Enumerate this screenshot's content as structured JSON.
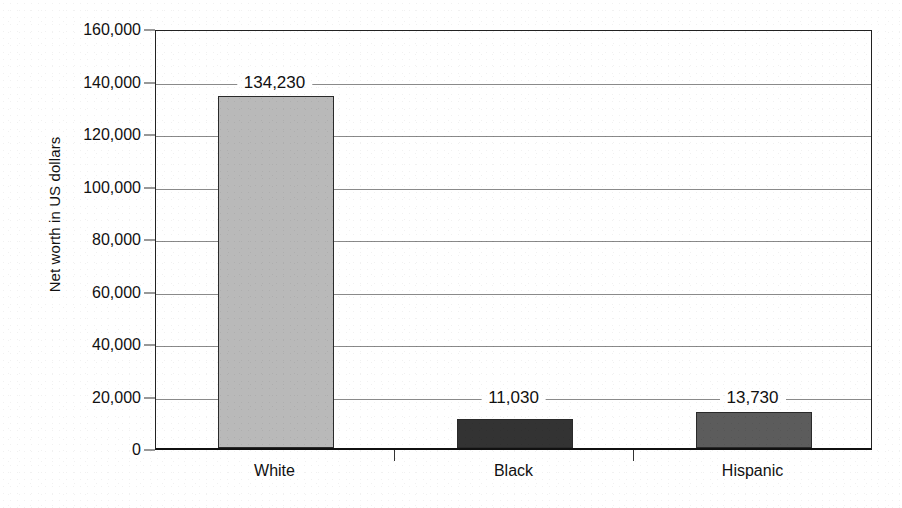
{
  "chart_data": {
    "type": "bar",
    "title": "",
    "xlabel": "",
    "ylabel": "Net worth in US dollars",
    "categories": [
      "White",
      "Black",
      "Hispanic"
    ],
    "values": [
      134230,
      11030,
      13730
    ],
    "value_labels": [
      "134,230",
      "11,030",
      "13,730"
    ],
    "series": [
      {
        "name": "Median net worth",
        "values": [
          134230,
          11030,
          13730
        ]
      }
    ],
    "ylim": [
      0,
      160000
    ],
    "ytick_step": 20000,
    "ytick_values": [
      0,
      20000,
      40000,
      60000,
      80000,
      100000,
      120000,
      140000,
      160000
    ],
    "ytick_labels": [
      "0",
      "20,000",
      "40,000",
      "60,000",
      "80,000",
      "100,000",
      "120,000",
      "140,000",
      "160,000"
    ],
    "grid": true,
    "legend": "none",
    "bar_colors": [
      "#b9b9b9",
      "#333333",
      "#5c5c5c"
    ],
    "bar_border_color": "#2a2a2a",
    "gridline_color": "#8a8a8a",
    "axis_color": "#222222",
    "background_color": "#ffffff"
  }
}
